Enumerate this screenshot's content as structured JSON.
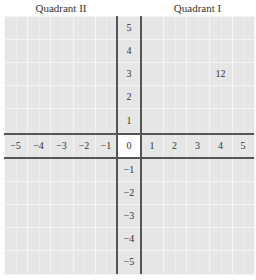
{
  "quadrants": {
    "q2_label": "Quadrant II",
    "q1_label": "Quadrant I"
  },
  "x_axis": {
    "ticks": [
      "−5",
      "−4",
      "−3",
      "−2",
      "−1",
      "0",
      "1",
      "2",
      "3",
      "4",
      "5"
    ]
  },
  "y_axis": {
    "ticks": [
      "5",
      "4",
      "3",
      "2",
      "1",
      "0",
      "−1",
      "−2",
      "−3",
      "−4",
      "−5"
    ]
  },
  "annotation": {
    "text": "12",
    "x": 4,
    "y": 3
  },
  "colors": {
    "grid_background": "#e6e6e6",
    "grid_lines": "#f4f4f4",
    "axis_lines": "#555555",
    "origin_cell": "#ffffff"
  }
}
